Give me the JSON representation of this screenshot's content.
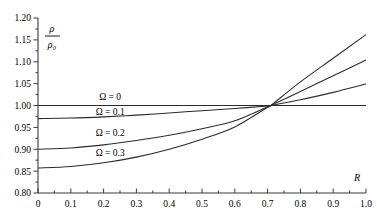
{
  "chart_data": {
    "type": "line",
    "title": "",
    "xlabel": "R",
    "ylabel_numerator": "ρ",
    "ylabel_denominator": "ρ₀",
    "xlim": [
      0.0,
      1.0
    ],
    "ylim": [
      0.8,
      1.2
    ],
    "grid": false,
    "legend_position": "inline-curve-labels",
    "x_ticks": [
      "0",
      "0.1",
      "0.2",
      "0.3",
      "0.4",
      "0.5",
      "0.6",
      "0.7",
      "0.8",
      "0.9",
      "1.0"
    ],
    "x_tick_values": [
      0.0,
      0.1,
      0.2,
      0.3,
      0.4,
      0.5,
      0.6,
      0.7,
      0.8,
      0.9,
      1.0
    ],
    "y_ticks": [
      "0.80",
      "0.85",
      "0.90",
      "0.95",
      "1.00",
      "1.05",
      "1.10",
      "1.15",
      "1.20"
    ],
    "y_tick_values": [
      0.8,
      0.85,
      0.9,
      0.95,
      1.0,
      1.05,
      1.1,
      1.15,
      1.2
    ],
    "crossing_point": {
      "x": 0.71,
      "y": 1.0
    },
    "series": [
      {
        "name": "Ω = 0",
        "label": "Ω = 0",
        "label_at": {
          "x": 0.22,
          "y": 1.012
        },
        "x": [
          0.0,
          0.1,
          0.2,
          0.3,
          0.4,
          0.5,
          0.6,
          0.7,
          0.71,
          0.8,
          0.9,
          1.0
        ],
        "values": [
          1.0,
          1.0,
          1.0,
          1.0,
          1.0,
          1.0,
          1.0,
          1.0,
          1.0,
          1.0,
          1.0,
          1.0
        ]
      },
      {
        "name": "Ω = 0.1",
        "label": "Ω = 0.1",
        "label_at": {
          "x": 0.22,
          "y": 0.978
        },
        "x": [
          0.0,
          0.1,
          0.2,
          0.3,
          0.4,
          0.5,
          0.6,
          0.7,
          0.71,
          0.8,
          0.9,
          1.0
        ],
        "values": [
          0.97,
          0.9712,
          0.974,
          0.978,
          0.983,
          0.988,
          0.993,
          0.999,
          1.0,
          1.013,
          1.03,
          1.049
        ]
      },
      {
        "name": "Ω = 0.2",
        "label": "Ω = 0.2",
        "label_at": {
          "x": 0.22,
          "y": 0.93
        },
        "x": [
          0.0,
          0.1,
          0.2,
          0.3,
          0.4,
          0.5,
          0.6,
          0.7,
          0.71,
          0.8,
          0.9,
          1.0
        ],
        "values": [
          0.9,
          0.903,
          0.91,
          0.92,
          0.932,
          0.947,
          0.965,
          0.997,
          1.0,
          1.032,
          1.068,
          1.104
        ]
      },
      {
        "name": "Ω = 0.3",
        "label": "Ω = 0.3",
        "label_at": {
          "x": 0.22,
          "y": 0.885
        },
        "x": [
          0.0,
          0.1,
          0.2,
          0.3,
          0.4,
          0.5,
          0.6,
          0.7,
          0.71,
          0.8,
          0.9,
          1.0
        ],
        "values": [
          0.857,
          0.8605,
          0.869,
          0.882,
          0.9,
          0.923,
          0.951,
          0.996,
          1.0,
          1.054,
          1.108,
          1.162
        ]
      }
    ],
    "colors": {
      "curve": "#2b2b2b",
      "axis": "#3a3a3a",
      "text": "#000000",
      "background": "#ffffff"
    }
  }
}
